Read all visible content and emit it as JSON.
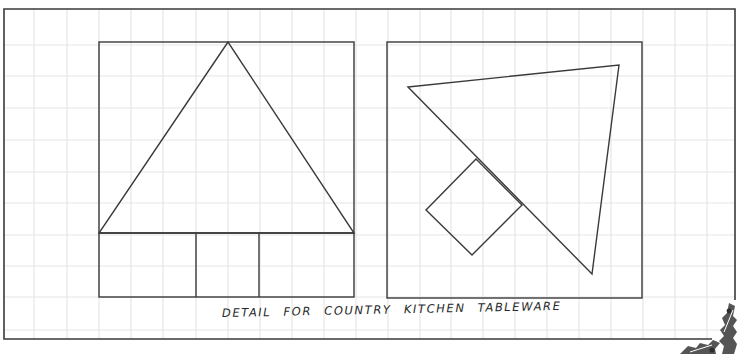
{
  "caption": "DETAIL FOR COUNTRY KITCHEN TABLEWARE",
  "colors": {
    "background": "#ffffff",
    "grid": "#e6e6e6",
    "ink": "#3a3a3a",
    "holly": "#555555",
    "berry": "#2e2e2e"
  },
  "grid": {
    "x_lines": [
      34,
      67,
      99,
      131,
      163,
      196,
      228,
      260,
      292,
      324,
      356,
      388,
      420,
      451,
      483,
      515,
      547,
      579,
      611,
      643,
      675,
      707
    ],
    "y_lines": [
      45,
      76,
      108,
      140,
      172,
      203,
      235,
      266,
      297,
      330
    ]
  },
  "outer_frame": {
    "x1": 4,
    "y1": 9,
    "x2": 735,
    "y2": 339
  },
  "left_panel": {
    "frame": {
      "x": 99,
      "y": 42,
      "w": 255,
      "h": 255
    },
    "tree_triangle": [
      [
        228,
        42
      ],
      [
        99,
        233
      ],
      [
        354,
        233
      ]
    ],
    "base_line_y": 233,
    "trunk_lines_x": [
      196,
      259
    ]
  },
  "right_panel": {
    "frame": {
      "x": 387,
      "y": 42,
      "w": 255,
      "h": 256
    },
    "tree_triangle": [
      [
        408,
        87
      ],
      [
        619,
        65
      ],
      [
        592,
        274
      ]
    ],
    "trunk_square": [
      [
        476,
        159
      ],
      [
        426,
        210
      ],
      [
        472,
        255
      ],
      [
        522,
        205
      ]
    ]
  },
  "decoration": {
    "name": "holly-corner",
    "position": "bottom-right"
  }
}
